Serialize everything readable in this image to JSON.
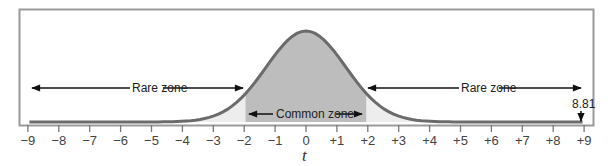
{
  "chart_data": {
    "type": "area",
    "title": "",
    "xlabel": "t",
    "ylabel": "",
    "xlim": [
      -9,
      9
    ],
    "x_ticks": [
      -9,
      -8,
      -7,
      -6,
      -5,
      -4,
      -3,
      -2,
      -1,
      0,
      1,
      2,
      3,
      4,
      5,
      6,
      7,
      8,
      9
    ],
    "x_tick_labels": [
      "−9",
      "−8",
      "−7",
      "−6",
      "−5",
      "−4",
      "−3",
      "−2",
      "−1",
      "0",
      "+1",
      "+2",
      "+3",
      "+4",
      "+5",
      "+6",
      "+7",
      "+8",
      "+9"
    ],
    "grid": false,
    "legend": null,
    "series": [
      {
        "name": "t distribution density",
        "shape": "bell curve centered at 0"
      }
    ],
    "regions": [
      {
        "name": "Rare zone",
        "from": -9,
        "to": -1.96,
        "fill": "#ededed"
      },
      {
        "name": "Common zone",
        "from": -1.96,
        "to": 1.96,
        "fill": "#bdbdbd"
      },
      {
        "name": "Rare zone",
        "from": 1.96,
        "to": 9,
        "fill": "#ededed"
      }
    ],
    "annotations": [
      {
        "text": "Rare zone",
        "type": "double-arrow",
        "from": -9,
        "to": -2
      },
      {
        "text": "Common zone",
        "type": "double-arrow",
        "from": -1.9,
        "to": 1.9
      },
      {
        "text": "Rare zone",
        "type": "double-arrow",
        "from": 2,
        "to": 9
      },
      {
        "text": "8.81",
        "type": "down-arrow",
        "x": 8.81
      }
    ]
  },
  "labels": {
    "rare_left": "Rare zone",
    "common": "Common zone",
    "rare_right": "Rare zone",
    "marker_value": "8.81",
    "axis_title": "t"
  },
  "colors": {
    "frame": "#9a9a9a",
    "curve": "#6b6b6b",
    "common_fill": "#bdbdbd",
    "tail_fill": "#ededed",
    "arrow": "#111111",
    "tick": "#777777"
  }
}
